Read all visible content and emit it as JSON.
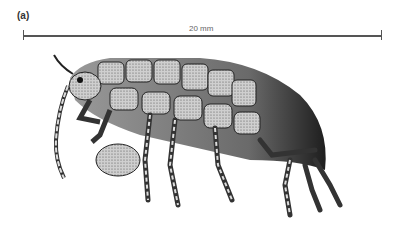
{
  "figure": {
    "panel_label": "(a)",
    "scale_bar": {
      "label": "20 mm"
    },
    "colors": {
      "ink": "#1a1a1a",
      "mid": "#8a8a8a",
      "light": "#d8d8d8",
      "background": "#ffffff"
    }
  }
}
